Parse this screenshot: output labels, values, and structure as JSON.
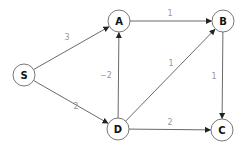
{
  "graph": {
    "nodes": [
      {
        "id": "S",
        "label": "S",
        "x": 24,
        "y": 75
      },
      {
        "id": "A",
        "label": "A",
        "x": 119,
        "y": 21
      },
      {
        "id": "B",
        "label": "B",
        "x": 223,
        "y": 21
      },
      {
        "id": "D",
        "label": "D",
        "x": 118,
        "y": 129
      },
      {
        "id": "C",
        "label": "C",
        "x": 222,
        "y": 130
      }
    ],
    "edges": [
      {
        "from": "S",
        "to": "A",
        "weight": "3",
        "lx": 67,
        "ly": 37
      },
      {
        "from": "S",
        "to": "D",
        "weight": "2",
        "lx": 76,
        "ly": 106
      },
      {
        "from": "A",
        "to": "B",
        "weight": "1",
        "lx": 170,
        "ly": 13
      },
      {
        "from": "D",
        "to": "A",
        "weight": "−2",
        "lx": 106,
        "ly": 75
      },
      {
        "from": "D",
        "to": "B",
        "weight": "1",
        "lx": 171,
        "ly": 63
      },
      {
        "from": "B",
        "to": "C",
        "weight": "1",
        "lx": 214,
        "ly": 76
      },
      {
        "from": "D",
        "to": "C",
        "weight": "2",
        "lx": 170,
        "ly": 122
      }
    ],
    "node_radius": 11
  }
}
